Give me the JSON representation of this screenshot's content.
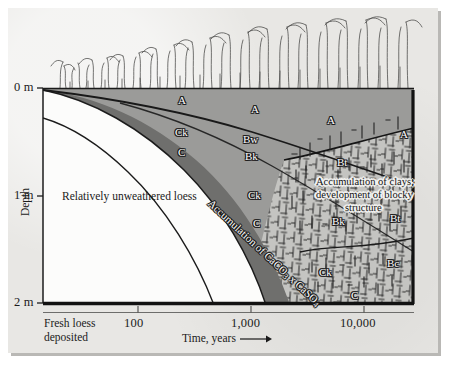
{
  "figure": {
    "kind": "soil-chronosequence-cross-section",
    "caption_present": false
  },
  "axes": {
    "y": {
      "title": "Depth",
      "ticks": [
        {
          "label": "0 m",
          "value": 0
        },
        {
          "label": "1 m",
          "value": 1
        },
        {
          "label": "2 m",
          "value": 2
        }
      ]
    },
    "x": {
      "title": "Time, years",
      "arrow": "⟶",
      "origin_label_line1": "Fresh loess",
      "origin_label_line2": "deposited",
      "ticks": [
        {
          "label": "100",
          "value": 100
        },
        {
          "label": "1,000",
          "value": 1000
        },
        {
          "label": "10,000",
          "value": 10000
        }
      ]
    }
  },
  "annotations": {
    "unweathered": "Relatively unweathered loess",
    "carbonate_accumulation": "Accumulation of CaCO",
    "carbonate_accumulation_sub1": "3",
    "carbonate_accumulation_mid": " x CaSO",
    "carbonate_accumulation_sub2": "4",
    "clay_callout_line1": "Accumulation of clays;",
    "clay_callout_line2": "development of blocky",
    "clay_callout_line3": "structure"
  },
  "horizons": [
    {
      "code": "A",
      "id": "a-1"
    },
    {
      "code": "A",
      "id": "a-2"
    },
    {
      "code": "A",
      "id": "a-3"
    },
    {
      "code": "A",
      "id": "a-4"
    },
    {
      "code": "Ck",
      "id": "ck-1"
    },
    {
      "code": "C",
      "id": "c-1"
    },
    {
      "code": "Bw",
      "id": "bw-1"
    },
    {
      "code": "Bk",
      "id": "bk-1"
    },
    {
      "code": "Ck",
      "id": "ck-2"
    },
    {
      "code": "C",
      "id": "c-2"
    },
    {
      "code": "Ck",
      "id": "ck-3"
    },
    {
      "code": "C",
      "id": "c-3"
    },
    {
      "code": "Bt",
      "id": "bt-1"
    },
    {
      "code": "Bt",
      "id": "bt-2"
    },
    {
      "code": "Bk",
      "id": "bk-2"
    },
    {
      "code": "Bc",
      "id": "bc-1"
    }
  ],
  "colors": {
    "page": "#e8e7e4",
    "loess_unweathered": "#fbfbfa",
    "a_horizon": "#9a9a98",
    "b_horizon_dark": "#6e6e6c",
    "bt_zone": "#c2c2bf",
    "outline": "#141414",
    "paper_shadow": "#b9b8b5"
  }
}
